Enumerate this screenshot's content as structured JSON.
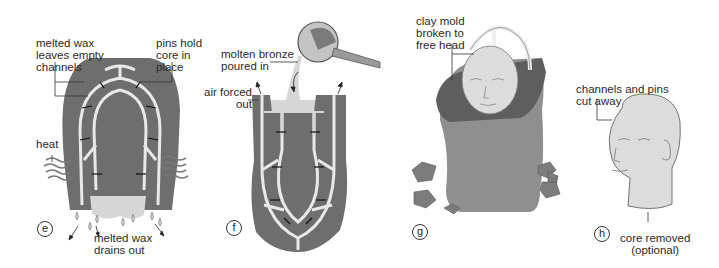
{
  "panels": [
    {
      "id": "e",
      "step": "e",
      "labels": {
        "channels": "melted wax\nleaves empty\nchannels",
        "pins": "pins hold\ncore in\nplace",
        "heat": "heat",
        "drain": "melted wax\ndrains out"
      }
    },
    {
      "id": "f",
      "step": "f",
      "labels": {
        "bronze": "molten bronze\npoured in",
        "air": "air forced\nout"
      }
    },
    {
      "id": "g",
      "step": "g",
      "labels": {
        "clay": "clay mold\nbroken to\nfree head"
      }
    },
    {
      "id": "h",
      "step": "h",
      "labels": {
        "channels": "channels and pins\ncut away",
        "core": "core removed\n(optional)"
      }
    }
  ],
  "colors": {
    "mold": "#6e6e6e",
    "channel": "#e8e8e8",
    "bronze": "#d6d6d6",
    "head": "#dcdcdc",
    "clay": "#8f8f8f",
    "outline": "#333333"
  }
}
